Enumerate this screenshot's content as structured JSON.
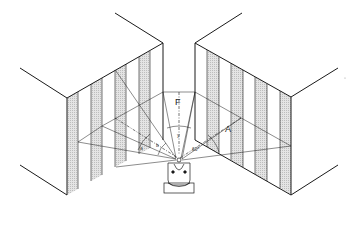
{
  "figure": {
    "labels": {
      "F": "F",
      "A": "A",
      "y": "y",
      "a": "a",
      "b": "b",
      "angle_60": "60°",
      "angle_30": "30°"
    },
    "colors": {
      "line": "#1a1a1a",
      "stripe_fill": "#d9d9d9",
      "background": "#ffffff"
    }
  }
}
